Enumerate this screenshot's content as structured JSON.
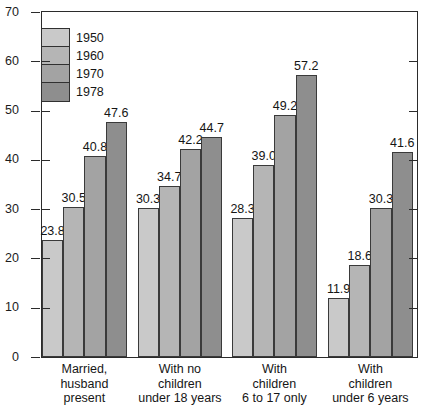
{
  "chart_data": {
    "type": "bar",
    "title": "",
    "subtitle": "",
    "xlabel": "",
    "ylabel": "",
    "ylim": [
      0,
      70
    ],
    "yticks": [
      0,
      10,
      20,
      30,
      40,
      50,
      60,
      70
    ],
    "grid": false,
    "legend_position": "inside-top-left",
    "categories": [
      "Married,\nhusband\npresent",
      "With no\nchildren\nunder 18 years",
      "With\nchildren\n6 to 17 only",
      "With\nchildren\nunder 6 years"
    ],
    "category_lines": [
      [
        "Married,",
        "husband",
        "present"
      ],
      [
        "With no",
        "children",
        "under 18 years"
      ],
      [
        "With",
        "children",
        "6 to 17 only"
      ],
      [
        "With",
        "children",
        "under 6 years"
      ]
    ],
    "series": [
      {
        "name": "1950",
        "color": "#c9c9c9",
        "values": [
          23.8,
          30.3,
          28.3,
          11.9
        ]
      },
      {
        "name": "1960",
        "color": "#b5b5b5",
        "values": [
          30.5,
          34.7,
          39.0,
          18.6
        ]
      },
      {
        "name": "1970",
        "color": "#a3a3a3",
        "values": [
          40.8,
          42.2,
          49.2,
          30.3
        ]
      },
      {
        "name": "1978",
        "color": "#8e8e8e",
        "values": [
          47.6,
          44.7,
          57.2,
          41.6
        ]
      }
    ],
    "value_labels": [
      [
        "23.8",
        "30.5",
        "40.8",
        "47.6"
      ],
      [
        "30.3",
        "34.7",
        "42.2",
        "44.7"
      ],
      [
        "28.3",
        "39.0",
        "49.2",
        "57.2"
      ],
      [
        "11.9",
        "18.6",
        "30.3",
        "41.6"
      ]
    ],
    "ytick_labels": [
      "0",
      "10",
      "20",
      "30",
      "40",
      "50",
      "60",
      "70"
    ]
  },
  "legend": {
    "entries": [
      {
        "label": "1950",
        "color": "#c9c9c9"
      },
      {
        "label": "1960",
        "color": "#b5b5b5"
      },
      {
        "label": "1970",
        "color": "#a3a3a3"
      },
      {
        "label": "1978",
        "color": "#8e8e8e"
      }
    ]
  }
}
